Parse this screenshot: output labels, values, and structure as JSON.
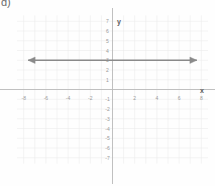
{
  "corner": {
    "label": "d)"
  },
  "axes": {
    "x_name": "x",
    "y_name": "y",
    "x_name_pos": {
      "x": 202,
      "y": 90
    },
    "y_name_pos": {
      "x": 119,
      "y": 21
    }
  },
  "colors": {
    "background": "#fefefe",
    "grid": "#e8e8e8",
    "axis": "#b9b9b9",
    "line": "#8a8a8a",
    "tick_text": "#9a9a9a",
    "axis_text": "#5a5a5a",
    "corner_text": "#6b6b6b"
  },
  "chart_data": {
    "type": "line",
    "title": "",
    "xlabel": "x",
    "ylabel": "y",
    "xlim": [
      -8.6,
      8.6
    ],
    "ylim": [
      -7.6,
      7.6
    ],
    "grid": true,
    "legend": "none",
    "x_ticks": [
      -8,
      -6,
      -4,
      -2,
      2,
      4,
      6,
      8
    ],
    "x_tick_labels": [
      "-8",
      "-6",
      "-4",
      "-2",
      "2",
      "4",
      "6",
      "8"
    ],
    "y_ticks": [
      7,
      6,
      5,
      4,
      3,
      2,
      1,
      -1,
      -2,
      -3,
      -4,
      -5,
      -6,
      -7
    ],
    "y_tick_labels": [
      "7",
      "6",
      "5",
      "4",
      "3",
      "2",
      "1",
      "-1",
      "-2",
      "-3",
      "-4",
      "-5",
      "-6",
      "-7"
    ],
    "x_minor_step": 1,
    "y_minor_step": 1,
    "series": [
      {
        "name": "y = 3",
        "equation": "y = 3",
        "type": "horizontal-line",
        "y_value": 3,
        "x_start": -7.6,
        "x_end": 7.6,
        "arrows": [
          "left",
          "right"
        ],
        "color": "#8a8a8a"
      }
    ]
  }
}
